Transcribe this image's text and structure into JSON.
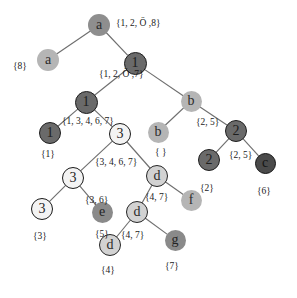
{
  "figure": {
    "width": 297,
    "height": 298,
    "background": "#ffffff"
  },
  "palette": {
    "edge": "#6f6f6f",
    "text": "#1b1b1b",
    "node_mid": "#8e8e8e",
    "node_dark": "#6a6a6a",
    "node_very_dark": "#4a4a4a",
    "node_light": "#d2d2d2",
    "node_plain": "#b5b5b5",
    "node_white": "#f3f3f3",
    "node_ring": "#1a1a1a"
  },
  "nodes": [
    {
      "id": "n-root-a",
      "label": "a",
      "x": 99,
      "y": 25,
      "r": 11,
      "fill": "mid",
      "font": 14
    },
    {
      "id": "n-a-left",
      "label": "a",
      "x": 48,
      "y": 60,
      "r": 11,
      "fill": "plain",
      "font": 14
    },
    {
      "id": "n-1-top",
      "label": "1",
      "x": 135,
      "y": 63,
      "r": 11.5,
      "fill": "dark",
      "font": 14
    },
    {
      "id": "n-1-mid",
      "label": "1",
      "x": 86,
      "y": 102,
      "r": 11.5,
      "fill": "dark",
      "font": 14
    },
    {
      "id": "n-b-top",
      "label": "b",
      "x": 191,
      "y": 101,
      "r": 10.5,
      "fill": "plain",
      "font": 14
    },
    {
      "id": "n-1-leaf",
      "label": "1",
      "x": 50,
      "y": 133,
      "r": 11,
      "fill": "dark",
      "font": 14
    },
    {
      "id": "n-3-mid",
      "label": "3",
      "x": 120,
      "y": 134,
      "r": 11,
      "fill": "white",
      "font": 14
    },
    {
      "id": "n-b-leaf",
      "label": "b",
      "x": 158,
      "y": 132,
      "r": 10.5,
      "fill": "plain",
      "font": 14
    },
    {
      "id": "n-2-mid",
      "label": "2",
      "x": 236,
      "y": 131,
      "r": 11,
      "fill": "dark",
      "font": 14
    },
    {
      "id": "n-3-low",
      "label": "3",
      "x": 73,
      "y": 178,
      "r": 11,
      "fill": "white",
      "font": 14
    },
    {
      "id": "n-d-mid",
      "label": "d",
      "x": 157,
      "y": 176,
      "r": 11,
      "fill": "light",
      "font": 14
    },
    {
      "id": "n-2-leaf",
      "label": "2",
      "x": 209,
      "y": 160,
      "r": 11,
      "fill": "dark",
      "font": 14
    },
    {
      "id": "n-c-leaf",
      "label": "c",
      "x": 265,
      "y": 163,
      "r": 10.5,
      "fill": "vdark",
      "font": 14
    },
    {
      "id": "n-3-leaf",
      "label": "3",
      "x": 42,
      "y": 209,
      "r": 11,
      "fill": "white",
      "font": 14
    },
    {
      "id": "n-e-leaf",
      "label": "e",
      "x": 102,
      "y": 212,
      "r": 10.5,
      "fill": "dgrey",
      "font": 14
    },
    {
      "id": "n-d-low",
      "label": "d",
      "x": 137,
      "y": 212,
      "r": 11,
      "fill": "light",
      "font": 14
    },
    {
      "id": "n-f-leaf",
      "label": "f",
      "x": 191,
      "y": 200,
      "r": 10.5,
      "fill": "plain",
      "font": 14
    },
    {
      "id": "n-d-leaf",
      "label": "d",
      "x": 110,
      "y": 245,
      "r": 11,
      "fill": "light",
      "font": 14
    },
    {
      "id": "n-g-leaf",
      "label": "g",
      "x": 175,
      "y": 240,
      "r": 10.5,
      "fill": "dgrey",
      "font": 14
    }
  ],
  "edges": [
    {
      "id": "e-root-a-to-a-left",
      "from": "n-root-a",
      "to": "n-a-left"
    },
    {
      "id": "e-root-a-to-1-top",
      "from": "n-root-a",
      "to": "n-1-top"
    },
    {
      "id": "e-1-top-to-1-mid",
      "from": "n-1-top",
      "to": "n-1-mid"
    },
    {
      "id": "e-1-top-to-b-top",
      "from": "n-1-top",
      "to": "n-b-top"
    },
    {
      "id": "e-1-mid-to-1-leaf",
      "from": "n-1-mid",
      "to": "n-1-leaf"
    },
    {
      "id": "e-1-mid-to-3-mid",
      "from": "n-1-mid",
      "to": "n-3-mid"
    },
    {
      "id": "e-b-top-to-b-leaf",
      "from": "n-b-top",
      "to": "n-b-leaf"
    },
    {
      "id": "e-b-top-to-2-mid",
      "from": "n-b-top",
      "to": "n-2-mid"
    },
    {
      "id": "e-3-mid-to-3-low",
      "from": "n-3-mid",
      "to": "n-3-low"
    },
    {
      "id": "e-3-mid-to-d-mid",
      "from": "n-3-mid",
      "to": "n-d-mid"
    },
    {
      "id": "e-2-mid-to-2-leaf",
      "from": "n-2-mid",
      "to": "n-2-leaf"
    },
    {
      "id": "e-2-mid-to-c-leaf",
      "from": "n-2-mid",
      "to": "n-c-leaf"
    },
    {
      "id": "e-3-low-to-3-leaf",
      "from": "n-3-low",
      "to": "n-3-leaf"
    },
    {
      "id": "e-3-low-to-e-leaf",
      "from": "n-3-low",
      "to": "n-e-leaf"
    },
    {
      "id": "e-d-mid-to-d-low",
      "from": "n-d-mid",
      "to": "n-d-low"
    },
    {
      "id": "e-d-mid-to-f-leaf",
      "from": "n-d-mid",
      "to": "n-f-leaf"
    },
    {
      "id": "e-d-low-to-d-leaf",
      "from": "n-d-low",
      "to": "n-d-leaf"
    },
    {
      "id": "e-d-low-to-g-leaf",
      "from": "n-d-low",
      "to": "n-g-leaf"
    }
  ],
  "set_labels": [
    {
      "id": "s-root",
      "text": "{1, 2, Ö ,8}",
      "x": 116,
      "y": 19,
      "font": 9.5
    },
    {
      "id": "s-a-left",
      "text": "{8}",
      "x": 13,
      "y": 62,
      "font": 9.5
    },
    {
      "id": "s-1-top",
      "text": "{1, 2, Ö ,7}",
      "x": 99,
      "y": 70,
      "font": 9.5
    },
    {
      "id": "s-1-mid",
      "text": "{1, 3, 4, 6, 7}",
      "x": 62,
      "y": 117,
      "font": 9.5
    },
    {
      "id": "s-b-top",
      "text": "{2, 5}",
      "x": 196,
      "y": 118,
      "font": 9.5
    },
    {
      "id": "s-1-leaf",
      "text": "{1}",
      "x": 41,
      "y": 150,
      "font": 9.5
    },
    {
      "id": "s-b-leaf",
      "text": "{ }",
      "x": 155,
      "y": 148,
      "font": 9.5
    },
    {
      "id": "s-3-mid",
      "text": "{3, 4, 6, 7}",
      "x": 95,
      "y": 158,
      "font": 9.5
    },
    {
      "id": "s-2-mid",
      "text": "{2, 5}",
      "x": 229,
      "y": 151,
      "font": 9.5
    },
    {
      "id": "s-2-leaf",
      "text": "{2}",
      "x": 200,
      "y": 184,
      "font": 9.5
    },
    {
      "id": "s-c-leaf",
      "text": "{6}",
      "x": 257,
      "y": 187,
      "font": 9.5
    },
    {
      "id": "s-3-low",
      "text": "{3, 6}",
      "x": 85,
      "y": 196,
      "font": 9.5
    },
    {
      "id": "s-d-mid",
      "text": "{4, 7}",
      "x": 145,
      "y": 193,
      "font": 9.5
    },
    {
      "id": "s-3-leaf",
      "text": "{3}",
      "x": 33,
      "y": 232,
      "font": 9.5
    },
    {
      "id": "s-e-leaf",
      "text": "{5}",
      "x": 95,
      "y": 230,
      "font": 9.5
    },
    {
      "id": "s-d-low",
      "text": "{4, 7}",
      "x": 121,
      "y": 231,
      "font": 9.5
    },
    {
      "id": "s-d-leaf",
      "text": "{4}",
      "x": 101,
      "y": 266,
      "font": 9.5
    },
    {
      "id": "s-g-leaf",
      "text": "{7}",
      "x": 165,
      "y": 262,
      "font": 9.5
    }
  ]
}
